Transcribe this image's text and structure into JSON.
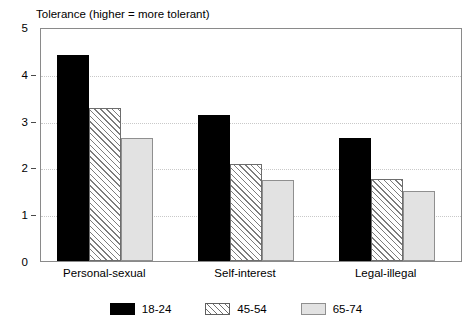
{
  "chart_data": {
    "type": "bar",
    "title": "Tolerance (higher = more tolerant)",
    "xlabel": "",
    "ylabel": "",
    "ylim": [
      0,
      5
    ],
    "yticks": [
      0,
      1,
      2,
      3,
      4,
      5
    ],
    "ytick_labels": [
      "0",
      "1",
      "2",
      "3",
      "4",
      "5"
    ],
    "grid": true,
    "grid_axis": "y",
    "legend_position": "bottom-center",
    "categories": [
      "Personal-sexual",
      "Self-interest",
      "Legal-illegal"
    ],
    "series": [
      {
        "name": "18-24",
        "values": [
          4.4,
          3.12,
          2.62
        ],
        "fill": "#000000",
        "pattern": "solid-black"
      },
      {
        "name": "45-54",
        "values": [
          3.26,
          2.07,
          1.75
        ],
        "fill": "#ffffff",
        "pattern": "diagonal-hatch"
      },
      {
        "name": "65-74",
        "values": [
          2.63,
          1.73,
          1.5
        ],
        "fill": "#e2e2e2",
        "pattern": "solid-gray"
      }
    ]
  }
}
